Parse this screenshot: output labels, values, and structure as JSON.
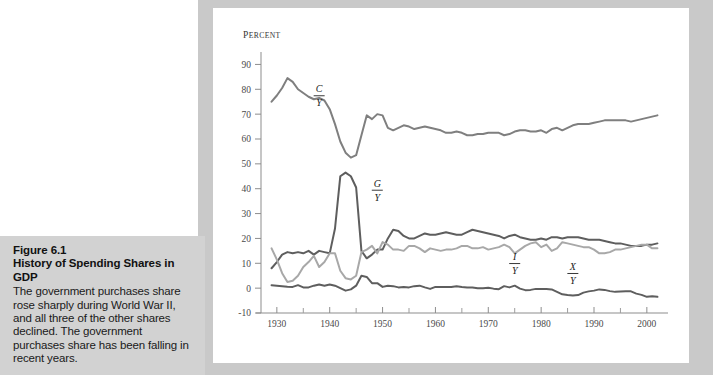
{
  "caption": {
    "figure_number": "Figure 6.1",
    "figure_title": "History of Spending Shares in GDP",
    "body": "The government purchases share rose sharply during World War II, and all three of the other shares declined. The government purchases share has been falling in recent years."
  },
  "chart_data": {
    "type": "line",
    "title": "History of Spending Shares in GDP",
    "xlabel": "",
    "ylabel": "Percent",
    "ylabel_display": "PERCENT",
    "xlim": [
      1927,
      2004
    ],
    "ylim": [
      -10,
      95
    ],
    "yticks": [
      -10,
      0,
      10,
      20,
      30,
      40,
      50,
      60,
      70,
      80,
      90
    ],
    "ytick_labels": [
      "-10",
      "0",
      "10",
      "20",
      "30",
      "40",
      "50",
      "60",
      "70",
      "80",
      "90"
    ],
    "xticks": [
      1930,
      1940,
      1950,
      1960,
      1970,
      1980,
      1990,
      2000
    ],
    "xtick_labels": [
      "1930",
      "1940",
      "1950",
      "1960",
      "1970",
      "1980",
      "1990",
      "2000"
    ],
    "xminor_ticks": [
      1935,
      1945,
      1955,
      1965,
      1975,
      1985,
      1995
    ],
    "grid": false,
    "legend": "inline-labels",
    "colors": {
      "consumption": "#7f7f7f",
      "government": "#5e5e5e",
      "investment": "#a8a8a8",
      "netexports": "#5e5e5e"
    },
    "x": [
      1929,
      1930,
      1931,
      1932,
      1933,
      1934,
      1935,
      1936,
      1937,
      1938,
      1939,
      1940,
      1941,
      1942,
      1943,
      1944,
      1945,
      1946,
      1947,
      1948,
      1949,
      1950,
      1951,
      1952,
      1953,
      1954,
      1955,
      1956,
      1957,
      1958,
      1959,
      1960,
      1961,
      1962,
      1963,
      1964,
      1965,
      1966,
      1967,
      1968,
      1969,
      1970,
      1971,
      1972,
      1973,
      1974,
      1975,
      1976,
      1977,
      1978,
      1979,
      1980,
      1981,
      1982,
      1983,
      1984,
      1985,
      1986,
      1987,
      1988,
      1989,
      1990,
      1991,
      1992,
      1993,
      1994,
      1995,
      1996,
      1997,
      1998,
      1999,
      2000,
      2001,
      2002
    ],
    "series": [
      {
        "name": "C/Y",
        "label": "C/Y",
        "label_numerator": "C",
        "label_denominator": "Y",
        "description": "Consumption share of GDP",
        "color": "#7f7f7f",
        "label_x": 1938,
        "label_y": 78,
        "values": [
          75.0,
          77.5,
          80.5,
          84.5,
          83.0,
          80.0,
          78.5,
          77.0,
          76.0,
          76.5,
          75.5,
          72.0,
          66.0,
          59.0,
          54.5,
          52.5,
          53.5,
          61.5,
          69.5,
          68.0,
          70.0,
          69.5,
          64.5,
          63.5,
          64.5,
          65.5,
          65.0,
          64.0,
          64.5,
          65.0,
          64.5,
          64.0,
          63.5,
          62.5,
          62.5,
          63.0,
          62.5,
          61.5,
          61.5,
          62.0,
          62.0,
          62.5,
          62.5,
          62.5,
          61.5,
          62.0,
          63.0,
          63.5,
          63.5,
          63.0,
          63.0,
          63.5,
          62.5,
          64.0,
          64.5,
          63.5,
          64.5,
          65.5,
          66.0,
          66.0,
          66.0,
          66.5,
          67.0,
          67.5,
          67.5,
          67.5,
          67.5,
          67.5,
          67.0,
          67.5,
          68.0,
          68.5,
          69.0,
          69.5
        ]
      },
      {
        "name": "G/Y",
        "label": "G/Y",
        "label_numerator": "G",
        "label_denominator": "Y",
        "description": "Government purchases share of GDP",
        "color": "#5e5e5e",
        "label_x": 1949,
        "label_y": 40,
        "values": [
          8.0,
          10.5,
          13.5,
          14.5,
          14.0,
          14.5,
          14.0,
          15.0,
          13.5,
          15.0,
          14.5,
          14.0,
          24.0,
          45.0,
          46.5,
          45.0,
          40.5,
          15.0,
          12.0,
          13.5,
          15.5,
          15.5,
          20.0,
          23.5,
          23.0,
          21.0,
          20.0,
          20.0,
          21.0,
          22.0,
          21.5,
          21.5,
          22.0,
          22.5,
          22.0,
          21.5,
          21.5,
          22.5,
          23.5,
          23.0,
          22.5,
          22.0,
          21.5,
          21.0,
          20.0,
          21.0,
          21.5,
          20.5,
          20.0,
          19.5,
          19.5,
          20.0,
          19.5,
          20.5,
          20.5,
          20.0,
          20.5,
          20.5,
          20.5,
          20.0,
          19.5,
          19.5,
          19.5,
          19.0,
          18.5,
          18.0,
          18.0,
          17.5,
          17.0,
          17.0,
          17.0,
          17.5,
          17.5,
          18.0
        ]
      },
      {
        "name": "I/Y",
        "label": "I/Y",
        "label_numerator": "I",
        "label_denominator": "Y",
        "description": "Investment share of GDP",
        "color": "#a8a8a8",
        "label_x": 1975,
        "label_y": 10.5,
        "values": [
          16.0,
          11.5,
          6.0,
          2.5,
          3.0,
          5.0,
          8.5,
          10.5,
          13.0,
          8.5,
          10.5,
          14.0,
          14.0,
          7.0,
          4.0,
          3.5,
          5.0,
          14.5,
          15.5,
          17.0,
          14.0,
          18.5,
          17.5,
          15.5,
          15.5,
          15.0,
          17.0,
          17.0,
          16.0,
          14.5,
          16.0,
          15.5,
          15.0,
          15.5,
          15.5,
          16.0,
          17.0,
          17.0,
          16.0,
          16.0,
          16.5,
          15.5,
          16.0,
          16.5,
          17.5,
          16.5,
          14.0,
          15.5,
          17.0,
          18.0,
          18.5,
          16.5,
          17.5,
          15.0,
          16.0,
          18.5,
          18.0,
          17.5,
          17.0,
          16.5,
          16.5,
          15.5,
          14.0,
          14.0,
          14.5,
          15.5,
          15.5,
          16.0,
          16.5,
          17.0,
          17.5,
          17.5,
          16.0,
          16.0
        ]
      },
      {
        "name": "X/Y",
        "label": "X/Y",
        "label_numerator": "X",
        "label_denominator": "Y",
        "description": "Net exports share of GDP",
        "color": "#5e5e5e",
        "label_x": 1986,
        "label_y": 6.5,
        "values": [
          1.2,
          1.0,
          0.8,
          0.6,
          0.5,
          1.2,
          0.3,
          0.3,
          1.0,
          1.5,
          1.0,
          1.5,
          1.0,
          0.0,
          -1.0,
          -0.5,
          1.0,
          5.0,
          4.5,
          2.0,
          2.0,
          0.5,
          1.0,
          0.8,
          0.3,
          0.5,
          0.3,
          0.8,
          1.0,
          0.3,
          -0.3,
          0.5,
          0.5,
          0.5,
          0.5,
          0.8,
          0.5,
          0.3,
          0.3,
          0.0,
          0.0,
          0.2,
          -0.2,
          -0.4,
          0.8,
          0.3,
          1.0,
          -0.2,
          -0.8,
          -0.7,
          -0.3,
          -0.3,
          -0.3,
          -0.5,
          -1.5,
          -2.5,
          -2.8,
          -3.0,
          -2.8,
          -1.8,
          -1.3,
          -1.0,
          -0.5,
          -0.7,
          -1.2,
          -1.5,
          -1.4,
          -1.3,
          -1.3,
          -2.2,
          -2.7,
          -3.5,
          -3.3,
          -3.5
        ]
      }
    ]
  }
}
